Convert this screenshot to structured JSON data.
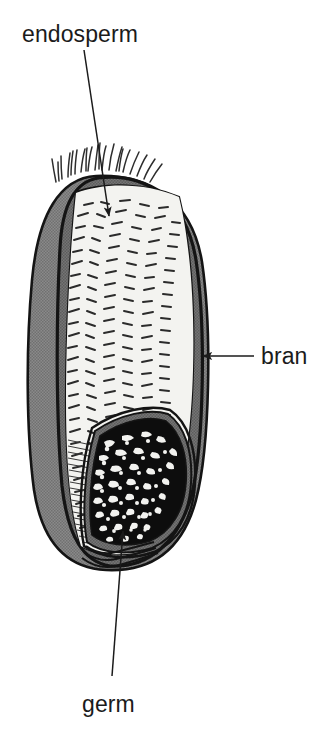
{
  "figure": {
    "background_color": "#ffffff",
    "width": 330,
    "height": 732
  },
  "labels": [
    {
      "id": "endosperm",
      "text": "endosperm",
      "x": 22,
      "y": 42,
      "anchor": "start",
      "leader": {
        "from_x": 84,
        "from_y": 50,
        "to_x": 109,
        "to_y": 216,
        "arrow": "end"
      }
    },
    {
      "id": "bran",
      "text": "bran",
      "x": 261,
      "y": 364,
      "anchor": "start",
      "leader": {
        "from_x": 254,
        "from_y": 356,
        "to_x": 203,
        "to_y": 356,
        "arrow": "end"
      }
    },
    {
      "id": "germ",
      "text": "germ",
      "x": 82,
      "y": 712,
      "anchor": "start",
      "leader": {
        "from_x": 112,
        "from_y": 676,
        "to_x": 123,
        "to_y": 531,
        "arrow": "end"
      }
    }
  ],
  "structures": [
    {
      "id": "pericarp-outline",
      "name": "outer seed coat outline",
      "color": "#141414"
    },
    {
      "id": "bran-layer",
      "name": "bran layer",
      "color": "#6e6e6e"
    },
    {
      "id": "endosperm-body",
      "name": "endosperm",
      "color": "#f2f2ef"
    },
    {
      "id": "germ-body",
      "name": "germ",
      "color": "#0d0d0d"
    },
    {
      "id": "grain-back",
      "name": "shaded back face of grain",
      "color": "#808080"
    },
    {
      "id": "brush-hairs",
      "name": "brush hairs at grain tip",
      "color": "#2a2a2a"
    }
  ],
  "colors": {
    "ink": "#141414",
    "grey_fill": "#808080",
    "bran_grey": "#6e6e6e",
    "endosperm_fill": "#f2f2ef",
    "germ_dark": "#0d0d0d",
    "background": "#ffffff"
  }
}
